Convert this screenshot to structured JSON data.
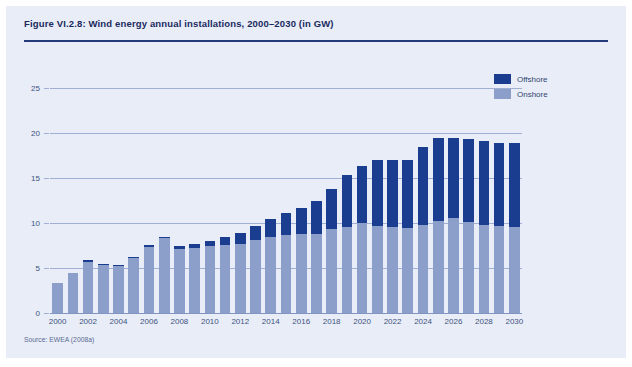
{
  "figure": {
    "title": "Figure VI.2.8: Wind energy annual installations, 2000–2030 (in GW)",
    "source": "Source: EWEA (2008a)",
    "panel_bg": "#e8edf7",
    "rule_color": "#253a78"
  },
  "legend": {
    "position": "top-right",
    "entries": [
      {
        "label": "Offshore",
        "color": "#1a3d8f"
      },
      {
        "label": "Onshore",
        "color": "#8c9fcb"
      }
    ]
  },
  "chart_data": {
    "type": "bar",
    "stacked": true,
    "title": "Figure VI.2.8: Wind energy annual installations, 2000–2030 (in GW)",
    "xlabel": "",
    "ylabel": "",
    "unit": "GW",
    "ylim": [
      0,
      25
    ],
    "yticks": [
      0,
      5,
      10,
      15,
      20,
      25
    ],
    "grid": true,
    "legend_position": "top-right",
    "xtick_labels": [
      "2000",
      "2002",
      "2004",
      "2006",
      "2008",
      "2010",
      "2012",
      "2014",
      "2016",
      "2018",
      "2020",
      "2022",
      "2024",
      "2026",
      "2028",
      "2030"
    ],
    "categories": [
      "2000",
      "2001",
      "2002",
      "2003",
      "2004",
      "2005",
      "2006",
      "2007",
      "2008",
      "2009",
      "2010",
      "2011",
      "2012",
      "2013",
      "2014",
      "2015",
      "2016",
      "2017",
      "2018",
      "2019",
      "2020",
      "2021",
      "2022",
      "2023",
      "2024",
      "2025",
      "2026",
      "2027",
      "2028",
      "2029",
      "2030"
    ],
    "series": [
      {
        "name": "Onshore",
        "color": "#8c9fcb",
        "values": [
          3.3,
          4.4,
          5.7,
          5.3,
          5.2,
          6.1,
          7.3,
          8.3,
          7.1,
          7.2,
          7.4,
          7.6,
          7.7,
          8.1,
          8.4,
          8.7,
          8.8,
          8.8,
          9.3,
          9.5,
          10.0,
          9.7,
          9.6,
          9.5,
          9.8,
          10.2,
          10.5,
          10.1,
          9.8,
          9.7,
          9.6
        ]
      },
      {
        "name": "Offshore",
        "color": "#1a3d8f",
        "values": [
          0.0,
          0.0,
          0.2,
          0.1,
          0.1,
          0.1,
          0.3,
          0.2,
          0.3,
          0.5,
          0.6,
          0.9,
          1.2,
          1.6,
          2.0,
          2.4,
          2.9,
          3.6,
          4.5,
          5.8,
          6.3,
          7.3,
          7.4,
          7.5,
          8.7,
          9.3,
          8.9,
          9.2,
          9.3,
          9.2,
          9.3
        ]
      }
    ],
    "totals": [
      3.3,
      4.4,
      5.9,
      5.4,
      5.3,
      6.2,
      7.6,
      8.5,
      7.4,
      7.7,
      8.0,
      8.5,
      8.9,
      9.7,
      10.4,
      11.1,
      11.7,
      12.4,
      13.8,
      15.3,
      16.3,
      17.0,
      17.0,
      17.0,
      18.5,
      19.5,
      19.4,
      19.3,
      19.1,
      18.9,
      18.9
    ]
  }
}
